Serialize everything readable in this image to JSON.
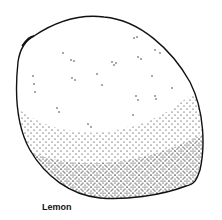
{
  "figure": {
    "subject": "lemon",
    "style": "stippled line illustration",
    "caption": "Lemon",
    "ink_color": "#111111",
    "background_color": "#ffffff"
  }
}
